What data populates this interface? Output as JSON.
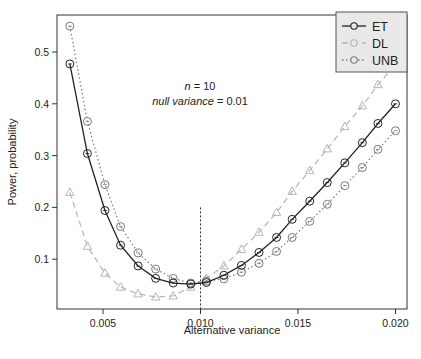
{
  "chart_data": {
    "type": "line",
    "title": "",
    "xlabel": "Alternative variance",
    "ylabel": "Power, probability",
    "xlim": [
      0.0027,
      0.0206
    ],
    "ylim": [
      0.01,
      0.575
    ],
    "grid": false,
    "legend_position": "top-right",
    "x_ticks": [
      0.005,
      0.01,
      0.015,
      0.02
    ],
    "x_tick_labels": [
      "0.005",
      "0.010",
      "0.015",
      "0.020"
    ],
    "y_ticks": [
      0.1,
      0.2,
      0.3,
      0.4,
      0.5
    ],
    "y_tick_labels": [
      "0.1",
      "0.2",
      "0.3",
      "0.4",
      "0.5"
    ],
    "annotations": {
      "line1_italic": "n",
      "line1_rest": " = 10",
      "line2_italic": "null variance",
      "line2_rest": " = 0.01",
      "vertical_reference_x": 0.01,
      "vertical_reference_top": 0.2
    },
    "x": [
      0.0033,
      0.0042,
      0.0051,
      0.0059,
      0.0068,
      0.0077,
      0.0086,
      0.0095,
      0.0103,
      0.0112,
      0.0121,
      0.013,
      0.0139,
      0.0147,
      0.0156,
      0.0165,
      0.0174,
      0.0183,
      0.0191,
      0.02
    ],
    "series": [
      {
        "name": "ET",
        "color": "#222222",
        "line_style": "solid",
        "marker": "circle",
        "values": [
          0.477,
          0.304,
          0.194,
          0.127,
          0.087,
          0.063,
          0.054,
          0.052,
          0.055,
          0.069,
          0.088,
          0.113,
          0.142,
          0.177,
          0.212,
          0.248,
          0.286,
          0.325,
          0.362,
          0.4
        ]
      },
      {
        "name": "DL",
        "color": "#b5b5b5",
        "line_style": "dashed",
        "marker": "triangle",
        "values": [
          0.229,
          0.125,
          0.073,
          0.046,
          0.033,
          0.027,
          0.029,
          0.046,
          0.063,
          0.087,
          0.119,
          0.152,
          0.19,
          0.231,
          0.271,
          0.313,
          0.356,
          0.396,
          0.437,
          0.475
        ]
      },
      {
        "name": "UNB",
        "color": "#7a7a7a",
        "line_style": "dotted",
        "marker": "circle",
        "values": [
          0.55,
          0.366,
          0.244,
          0.163,
          0.112,
          0.081,
          0.063,
          0.054,
          0.058,
          0.062,
          0.075,
          0.092,
          0.115,
          0.142,
          0.173,
          0.206,
          0.242,
          0.277,
          0.312,
          0.348
        ]
      }
    ]
  }
}
